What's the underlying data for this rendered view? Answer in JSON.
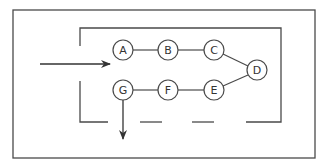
{
  "diagram": {
    "outer_frame": {
      "x": 13,
      "y": 10,
      "w": 302,
      "h": 148
    },
    "colors": {
      "stroke": "#4a4a4a",
      "background": "#ffffff"
    },
    "nodes": [
      {
        "id": "A",
        "label": "A",
        "cx": 123,
        "cy": 50
      },
      {
        "id": "B",
        "label": "B",
        "cx": 168,
        "cy": 50
      },
      {
        "id": "C",
        "label": "C",
        "cx": 214,
        "cy": 50
      },
      {
        "id": "D",
        "label": "D",
        "cx": 257,
        "cy": 70
      },
      {
        "id": "E",
        "label": "E",
        "cx": 214,
        "cy": 90
      },
      {
        "id": "F",
        "label": "F",
        "cx": 168,
        "cy": 90
      },
      {
        "id": "G",
        "label": "G",
        "cx": 123,
        "cy": 90
      }
    ],
    "edges": [
      [
        "A",
        "B"
      ],
      [
        "B",
        "C"
      ],
      [
        "C",
        "D"
      ],
      [
        "D",
        "E"
      ],
      [
        "E",
        "F"
      ],
      [
        "F",
        "G"
      ]
    ],
    "input_arrow": {
      "x1": 40,
      "y1": 64,
      "x2": 110,
      "y2": 64
    },
    "output_arrow": {
      "x1": 123,
      "y1": 100,
      "x2": 123,
      "y2": 139
    }
  }
}
